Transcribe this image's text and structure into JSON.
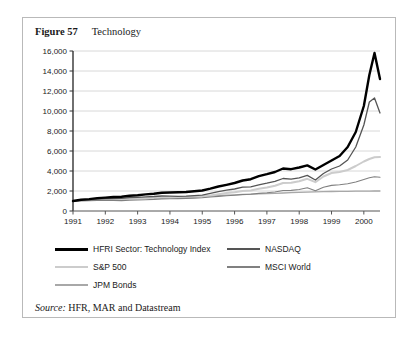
{
  "figure": {
    "number_label": "Figure 57",
    "name_label": "Technology",
    "source_keyword": "Source:",
    "source_text": "HFR, MAR and Datastream"
  },
  "colors": {
    "hfri": "#000000",
    "nasdaq": "#555555",
    "sp500": "#cccccc",
    "msci": "#808080",
    "jpm": "#a8a8a8",
    "grid": "#d8d8d8",
    "axis": "#555555",
    "border": "#b9b9b9",
    "background": "#ffffff"
  },
  "chart_data": {
    "type": "line",
    "title": "Technology",
    "xlabel": "",
    "ylabel": "",
    "grid": true,
    "legend_position": "below",
    "xlim": [
      1991,
      2000.5
    ],
    "ylim": [
      0,
      16000
    ],
    "ytick_labels": [
      "16,000",
      "14,000",
      "12,000",
      "10,000",
      "8,000",
      "6,000",
      "4,000",
      "2,000",
      "0"
    ],
    "ytick_values": [
      16000,
      14000,
      12000,
      10000,
      8000,
      6000,
      4000,
      2000,
      0
    ],
    "xtick_labels": [
      "1991",
      "1992",
      "1993",
      "1994",
      "1995",
      "1996",
      "1997",
      "1998",
      "1999",
      "2000"
    ],
    "xtick_values": [
      1991,
      1992,
      1993,
      1994,
      1995,
      1996,
      1997,
      1998,
      1999,
      2000
    ],
    "x": [
      1991.0,
      1991.25,
      1991.5,
      1991.75,
      1992.0,
      1992.25,
      1992.5,
      1992.75,
      1993.0,
      1993.25,
      1993.5,
      1993.75,
      1994.0,
      1994.25,
      1994.5,
      1994.75,
      1995.0,
      1995.25,
      1995.5,
      1995.75,
      1996.0,
      1996.25,
      1996.5,
      1996.75,
      1997.0,
      1997.25,
      1997.5,
      1997.75,
      1998.0,
      1998.25,
      1998.5,
      1998.75,
      1999.0,
      1999.25,
      1999.5,
      1999.75,
      2000.0,
      2000.17,
      2000.33,
      2000.5
    ],
    "series": [
      {
        "name": "HFRI Sector: Technology Index",
        "color": "#000000",
        "width": 2.4,
        "values": [
          1000,
          1120,
          1190,
          1290,
          1340,
          1400,
          1430,
          1520,
          1580,
          1660,
          1720,
          1820,
          1850,
          1870,
          1900,
          1980,
          2050,
          2230,
          2450,
          2620,
          2800,
          3050,
          3180,
          3480,
          3680,
          3900,
          4250,
          4180,
          4350,
          4560,
          4150,
          4600,
          5050,
          5500,
          6400,
          7900,
          10500,
          13600,
          15800,
          13200
        ]
      },
      {
        "name": "NASDAQ",
        "color": "#555555",
        "width": 1.3,
        "values": [
          1000,
          1080,
          1130,
          1200,
          1230,
          1250,
          1260,
          1330,
          1370,
          1420,
          1450,
          1500,
          1490,
          1470,
          1480,
          1530,
          1590,
          1760,
          1940,
          2080,
          2200,
          2380,
          2420,
          2620,
          2780,
          2960,
          3250,
          3180,
          3320,
          3560,
          3100,
          3750,
          4200,
          4500,
          5100,
          6400,
          8600,
          10900,
          11300,
          9800
        ]
      },
      {
        "name": "S&P 500",
        "color": "#cccccc",
        "width": 2.0,
        "values": [
          1000,
          1060,
          1090,
          1160,
          1180,
          1190,
          1200,
          1250,
          1270,
          1300,
          1320,
          1360,
          1350,
          1340,
          1350,
          1390,
          1430,
          1560,
          1680,
          1790,
          1880,
          2010,
          2060,
          2220,
          2360,
          2520,
          2800,
          2820,
          2980,
          3220,
          2880,
          3450,
          3800,
          3900,
          4100,
          4500,
          4950,
          5200,
          5380,
          5400
        ]
      },
      {
        "name": "MSCI World",
        "color": "#808080",
        "width": 1.1,
        "values": [
          1000,
          1030,
          1040,
          1060,
          1060,
          1050,
          1040,
          1080,
          1100,
          1130,
          1160,
          1210,
          1230,
          1240,
          1260,
          1290,
          1320,
          1400,
          1460,
          1520,
          1580,
          1650,
          1680,
          1760,
          1820,
          1900,
          2050,
          2060,
          2150,
          2320,
          2020,
          2380,
          2560,
          2620,
          2720,
          2900,
          3150,
          3320,
          3420,
          3380
        ]
      },
      {
        "name": "JPM Bonds",
        "color": "#a8a8a8",
        "width": 1.3,
        "values": [
          1000,
          1030,
          1060,
          1090,
          1120,
          1150,
          1180,
          1210,
          1250,
          1290,
          1320,
          1350,
          1370,
          1380,
          1400,
          1430,
          1470,
          1510,
          1550,
          1590,
          1620,
          1650,
          1680,
          1710,
          1740,
          1770,
          1800,
          1830,
          1860,
          1890,
          1910,
          1930,
          1950,
          1960,
          1970,
          1980,
          1990,
          1995,
          2000,
          2000
        ]
      }
    ]
  },
  "legend": {
    "left_items": [
      {
        "label": "HFRI Sector: Technology Index",
        "color": "#000000",
        "thickness": 3
      },
      {
        "label": "S&P 500",
        "color": "#cccccc",
        "thickness": 2
      },
      {
        "label": "JPM Bonds",
        "color": "#a8a8a8",
        "thickness": 2
      }
    ],
    "right_items": [
      {
        "label": "NASDAQ",
        "color": "#555555",
        "thickness": 2
      },
      {
        "label": "MSCI World",
        "color": "#808080",
        "thickness": 2
      }
    ]
  }
}
